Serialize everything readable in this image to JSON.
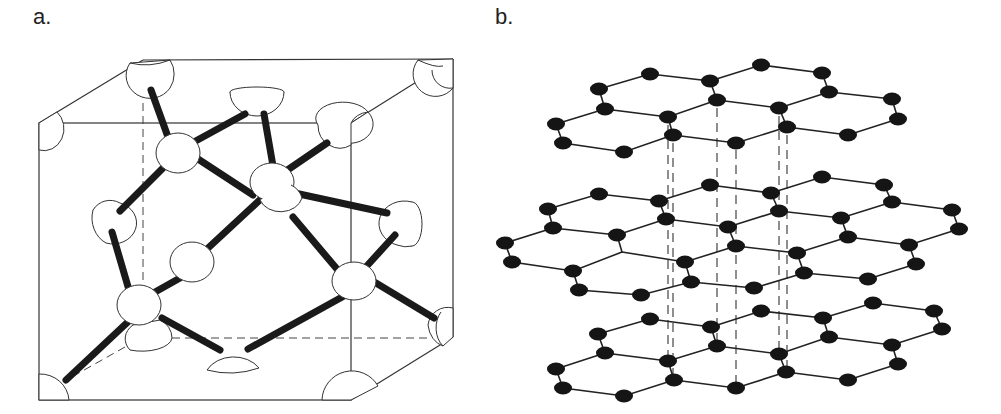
{
  "figure": {
    "panels": [
      {
        "id": "a",
        "label": "a.",
        "title": "Diamond cubic unit cell (tetrahedral sp3 bonding)",
        "structure": "diamond"
      },
      {
        "id": "b",
        "label": "b.",
        "title": "Graphite stacked hexagonal layers",
        "structure": "graphite",
        "layer_count": 3
      }
    ],
    "colors": {
      "line": "#333333",
      "bond": "#1a1a1a",
      "atom_fill_a": "#ffffff",
      "atom_fill_b": "#151515",
      "background": "#ffffff"
    }
  }
}
